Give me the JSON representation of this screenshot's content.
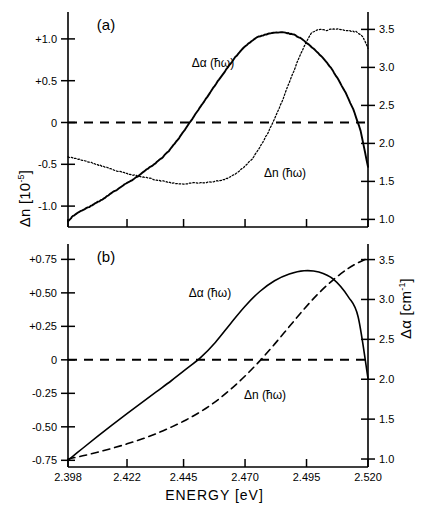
{
  "figure": {
    "xlabel": "ENERGY [eV]",
    "ylabel_left_pre": "Δn [10",
    "ylabel_left_sup": "-5",
    "ylabel_left_post": "]",
    "ylabel_right_pre": "Δα [cm",
    "ylabel_right_sup": "-1",
    "ylabel_right_post": "]",
    "panel_a_tag": "(a)",
    "panel_b_tag": "(b)",
    "curve_label_alpha": "Δα (ħω)",
    "curve_label_n": "Δn (ħω)",
    "colors": {
      "ink": "#000000",
      "background": "#ffffff"
    }
  },
  "chart_data": [
    {
      "type": "line",
      "panel": "(a)",
      "title": "",
      "xlabel": "ENERGY [eV]",
      "ylabel": "Δn [10^-5]",
      "ylabel_right": "Δα [cm^-1]",
      "xlim": [
        2.398,
        2.52
      ],
      "xticks": [
        2.398,
        2.422,
        2.445,
        2.47,
        2.495,
        2.52
      ],
      "xticklabels": [
        "2.398",
        "2.422",
        "2.445",
        "2.470",
        "2.495",
        "2.520"
      ],
      "ylim_left": [
        -1.25,
        1.25
      ],
      "yticks_left": [
        1.0,
        0.5,
        0.0,
        -0.5,
        -1.0
      ],
      "yticklabels_left": [
        "+1.0",
        "+0.5",
        "0",
        "-0.5",
        "-1.0"
      ],
      "ylim_right": [
        0.9,
        3.65
      ],
      "yticks_right": [
        3.5,
        3.0,
        2.5,
        2.0,
        1.5,
        1.0
      ],
      "yticklabels_right": [
        "3.5",
        "3.0",
        "2.5",
        "2.0",
        "1.5",
        "1.0"
      ],
      "grid": false,
      "zero_line": true,
      "legend": "inline-annotations",
      "series": [
        {
          "name": "Δα (ħω)",
          "style": "solid",
          "axis": "left",
          "note": "measured, noisy; rises from -1.18 at 2.398 through zero near 2.4475, peaks +1.08 near 2.4845, falls to -0.53 at 2.520",
          "x": [
            2.398,
            2.4,
            2.403,
            2.406,
            2.409,
            2.412,
            2.415,
            2.418,
            2.421,
            2.424,
            2.427,
            2.43,
            2.433,
            2.436,
            2.439,
            2.442,
            2.445,
            2.448,
            2.451,
            2.454,
            2.457,
            2.46,
            2.463,
            2.466,
            2.469,
            2.472,
            2.475,
            2.478,
            2.481,
            2.484,
            2.487,
            2.49,
            2.493,
            2.496,
            2.499,
            2.502,
            2.505,
            2.508,
            2.511,
            2.514,
            2.517,
            2.52
          ],
          "y": [
            -1.18,
            -1.12,
            -1.06,
            -1.02,
            -0.97,
            -0.92,
            -0.86,
            -0.8,
            -0.74,
            -0.69,
            -0.63,
            -0.56,
            -0.5,
            -0.43,
            -0.34,
            -0.23,
            -0.11,
            0.02,
            0.15,
            0.28,
            0.41,
            0.54,
            0.66,
            0.78,
            0.88,
            0.96,
            1.02,
            1.05,
            1.07,
            1.08,
            1.07,
            1.05,
            1.0,
            0.93,
            0.85,
            0.76,
            0.65,
            0.51,
            0.35,
            0.16,
            -0.1,
            -0.53
          ]
        },
        {
          "name": "Δn (ħω)",
          "style": "dotted",
          "axis": "right",
          "note": "measured, noisy; starts 1.82 at 2.398, dips to ~1.48 plateau 2.440-2.462, rises steeply to 3.50 peak near 2.497, slight ripple plateau, falls to 3.25 at 2.520",
          "x": [
            2.398,
            2.401,
            2.404,
            2.407,
            2.41,
            2.413,
            2.416,
            2.419,
            2.422,
            2.425,
            2.428,
            2.431,
            2.434,
            2.437,
            2.44,
            2.443,
            2.446,
            2.449,
            2.452,
            2.455,
            2.458,
            2.461,
            2.464,
            2.467,
            2.47,
            2.473,
            2.476,
            2.479,
            2.482,
            2.485,
            2.488,
            2.491,
            2.494,
            2.497,
            2.5,
            2.503,
            2.506,
            2.509,
            2.512,
            2.515,
            2.518,
            2.52
          ],
          "y": [
            1.82,
            1.8,
            1.78,
            1.75,
            1.72,
            1.69,
            1.66,
            1.63,
            1.6,
            1.58,
            1.56,
            1.54,
            1.52,
            1.5,
            1.48,
            1.47,
            1.47,
            1.48,
            1.48,
            1.49,
            1.5,
            1.52,
            1.56,
            1.62,
            1.7,
            1.8,
            1.95,
            2.12,
            2.32,
            2.55,
            2.8,
            3.05,
            3.28,
            3.45,
            3.5,
            3.49,
            3.51,
            3.5,
            3.48,
            3.47,
            3.4,
            3.25
          ]
        }
      ]
    },
    {
      "type": "line",
      "panel": "(b)",
      "title": "",
      "xlabel": "ENERGY [eV]",
      "ylabel": "Δn [10^-5]",
      "ylabel_right": "Δα [cm^-1]",
      "xlim": [
        2.398,
        2.52
      ],
      "xticks": [
        2.398,
        2.422,
        2.445,
        2.47,
        2.495,
        2.52
      ],
      "xticklabels": [
        "2.398",
        "2.422",
        "2.445",
        "2.470",
        "2.495",
        "2.520"
      ],
      "ylim_left": [
        -0.8,
        0.82
      ],
      "yticks_left": [
        0.75,
        0.5,
        0.25,
        0.0,
        -0.25,
        -0.5,
        -0.75
      ],
      "yticklabels_left": [
        "+0.75",
        "+0.50",
        "+0.25",
        "0",
        "-0.25",
        "-0.50",
        "-0.75"
      ],
      "ylim_right": [
        0.9,
        3.62
      ],
      "yticks_right": [
        3.5,
        3.0,
        2.5,
        2.0,
        1.5,
        1.0
      ],
      "yticklabels_right": [
        "3.5",
        "3.0",
        "2.5",
        "2.0",
        "1.5",
        "1.0"
      ],
      "grid": false,
      "zero_line": true,
      "legend": "inline-annotations",
      "series": [
        {
          "name": "Δα (ħω)",
          "style": "solid",
          "axis": "left",
          "note": "theory, smooth; starts -0.75 at 2.398, crosses zero near 2.4425, peaks +0.665 near 2.4935, falls to -0.14 at 2.520",
          "x": [
            2.398,
            2.404,
            2.41,
            2.416,
            2.422,
            2.428,
            2.434,
            2.44,
            2.446,
            2.452,
            2.458,
            2.464,
            2.47,
            2.476,
            2.482,
            2.488,
            2.494,
            2.5,
            2.506,
            2.512,
            2.516,
            2.52
          ],
          "y": [
            -0.75,
            -0.66,
            -0.572,
            -0.486,
            -0.402,
            -0.32,
            -0.238,
            -0.156,
            -0.07,
            0.018,
            0.132,
            0.268,
            0.4,
            0.51,
            0.59,
            0.64,
            0.665,
            0.655,
            0.6,
            0.47,
            0.32,
            -0.14
          ]
        },
        {
          "name": "Δn (ħω)",
          "style": "dashed",
          "axis": "right",
          "note": "theory, smooth; rises monotonically from 1.00 at 2.398 to 3.50 at 2.520, crossing the zero reference near 2.484",
          "x": [
            2.398,
            2.404,
            2.41,
            2.416,
            2.422,
            2.428,
            2.434,
            2.44,
            2.446,
            2.452,
            2.458,
            2.464,
            2.47,
            2.476,
            2.482,
            2.488,
            2.494,
            2.5,
            2.506,
            2.512,
            2.516,
            2.52
          ],
          "y": [
            1.0,
            1.04,
            1.085,
            1.135,
            1.19,
            1.25,
            1.32,
            1.4,
            1.49,
            1.595,
            1.72,
            1.87,
            2.04,
            2.23,
            2.44,
            2.66,
            2.88,
            3.08,
            3.25,
            3.39,
            3.46,
            3.52
          ]
        }
      ]
    }
  ]
}
